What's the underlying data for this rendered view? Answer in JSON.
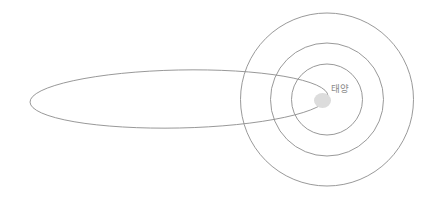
{
  "diagram": {
    "background_color": "#ffffff",
    "stroke_color": "#8d8d8d",
    "sun": {
      "label": "태양",
      "label_color": "#8a8a8a",
      "label_x": 331,
      "label_y": 92,
      "body_color": "#dcdcdc",
      "center_x": 322.5,
      "center_y": 100.5,
      "radius_x": 8.5,
      "radius_y": 7.5
    },
    "planet_orbits": [
      {
        "name": "inner-orbit",
        "center_x": 327,
        "center_y": 99.5,
        "radius": 35.5
      },
      {
        "name": "middle-orbit",
        "center_x": 327,
        "center_y": 99.5,
        "radius": 56.5
      },
      {
        "name": "outer-orbit",
        "center_x": 327,
        "center_y": 99.5,
        "radius": 86.5
      }
    ],
    "comet_orbit": {
      "name": "comet-elliptical-orbit",
      "center_x": 179,
      "center_y": 99,
      "radius_x": 149,
      "radius_y": 29,
      "rotation_deg": -1.2,
      "left_tip_x": 30,
      "right_tip_x": 328
    }
  }
}
